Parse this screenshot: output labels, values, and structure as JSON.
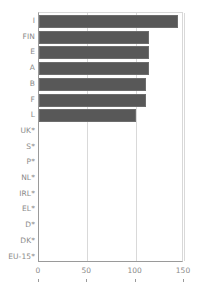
{
  "chart_data": {
    "type": "bar",
    "orientation": "horizontal",
    "title": "",
    "subtitle": "",
    "xlabel": "",
    "ylabel": "",
    "categories": [
      "I",
      "FIN",
      "E",
      "A",
      "B",
      "F",
      "L",
      "UK*",
      "S*",
      "P*",
      "NL*",
      "IRL*",
      "EL*",
      "D*",
      "DK*",
      "EU-15*"
    ],
    "values": [
      144,
      114,
      114,
      114,
      111,
      111,
      100,
      null,
      null,
      null,
      null,
      null,
      null,
      null,
      null,
      null
    ],
    "series": [
      {
        "name": "",
        "values": [
          144,
          114,
          114,
          114,
          111,
          111,
          100,
          null,
          null,
          null,
          null,
          null,
          null,
          null,
          null,
          null
        ]
      }
    ],
    "xlim": [
      0,
      150
    ],
    "xticks": [
      0,
      50,
      100,
      150
    ],
    "xtick_labels": [
      "0",
      "50",
      "100",
      "150"
    ],
    "grid": true,
    "grid_axis": "x",
    "legend": false,
    "legend_position": "none",
    "bar_color": "#585858",
    "bar_edge_color": "#6d6d6d",
    "axis_color": "#9a9a9a",
    "grid_color": "#d9d9d9",
    "label_color": "#8a8a8a",
    "background_color": "#ffffff",
    "note": "Categories marked with * have no bar plotted (no data)."
  }
}
